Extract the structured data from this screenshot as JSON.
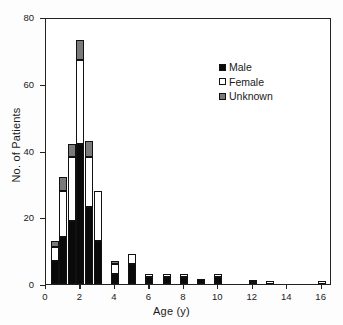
{
  "chart_data": {
    "type": "bar",
    "subtype": "stacked-histogram",
    "title": "",
    "xlabel": "Age (y)",
    "ylabel": "No. of Patients",
    "xlim": [
      0,
      16.6
    ],
    "ylim": [
      0,
      80
    ],
    "xticks": [
      0,
      2,
      4,
      6,
      8,
      10,
      12,
      14,
      16
    ],
    "yticks": [
      0,
      20,
      40,
      60,
      80
    ],
    "xtick_labels": [
      "0",
      "2",
      "4",
      "6",
      "8",
      "10",
      "12",
      "14",
      "16"
    ],
    "ytick_labels": [
      "0",
      "20",
      "40",
      "60",
      "80"
    ],
    "grid": false,
    "legend_position": "upper-right",
    "legend": [
      {
        "name": "Male",
        "color": "#0a0a0a",
        "marker": "filled-square"
      },
      {
        "name": "Female",
        "color": "#ffffff",
        "marker": "open-square"
      },
      {
        "name": "Unknown",
        "color": "#7a7a7a",
        "marker": "gray-square"
      }
    ],
    "bin_width": 0.5,
    "x": [
      0.5,
      1.0,
      1.5,
      2.0,
      2.5,
      3.0,
      4.0,
      5.0,
      6.0,
      7.0,
      8.0,
      9.0,
      10.0,
      12.0,
      13.0,
      16.0
    ],
    "series": [
      {
        "name": "Male",
        "color": "#0a0a0a",
        "values": [
          7,
          14,
          19,
          42,
          23,
          13,
          3,
          6,
          2,
          2,
          2,
          1.5,
          2,
          0,
          0,
          0
        ]
      },
      {
        "name": "Female",
        "color": "#ffffff",
        "values": [
          4,
          14,
          19,
          25,
          15,
          15,
          3,
          3,
          1,
          1,
          1,
          0,
          1,
          0.6,
          1,
          1
        ]
      },
      {
        "name": "Unknown",
        "color": "#7a7a7a",
        "values": [
          2,
          4,
          4,
          6,
          5,
          0,
          1,
          0,
          0,
          0,
          0,
          0,
          0,
          0.5,
          0,
          0
        ]
      }
    ],
    "totals": [
      13,
      32,
      42,
      73,
      43,
      28,
      7,
      9,
      3,
      3,
      3,
      1.5,
      3,
      1.1,
      1,
      1
    ]
  }
}
